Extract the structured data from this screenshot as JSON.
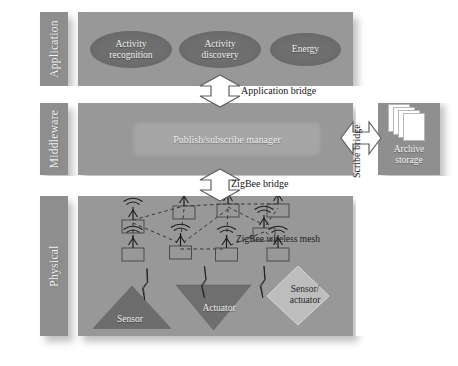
{
  "diagram": {
    "colors": {
      "background": "#ffffff",
      "panel": "#989898",
      "side_label_block": "#8e8e8e",
      "ellipse": "#6f6f6f",
      "manager_box": "#a6a6a6",
      "archive_block": "#8f8f8f",
      "device_dark": "#6d6d6d",
      "device_light": "#b9b9b9",
      "text_light": "#f2f2f2",
      "text_dark": "#151515"
    }
  },
  "layers": [
    {
      "name": "application",
      "side_label": "Application",
      "components": [
        {
          "label": "Activity\nrecognition",
          "line1": "Activity",
          "line2": "recognition",
          "shape": "ellipse"
        },
        {
          "label": "Activity\ndiscovery",
          "line1": "Activity",
          "line2": "discovery",
          "shape": "ellipse"
        },
        {
          "label": "Energy",
          "line1": "Energy",
          "line2": "",
          "shape": "ellipse"
        }
      ]
    },
    {
      "name": "middleware",
      "side_label": "Middleware",
      "components": [
        {
          "label": "Publish/subscribe manager",
          "shape": "rounded-rect"
        }
      ]
    },
    {
      "name": "physical",
      "side_label": "Physical",
      "mesh_label": "ZigBee wireless mesh",
      "devices": [
        {
          "label": "Sensor",
          "line1": "Sensor",
          "line2": "",
          "shape": "triangle-up"
        },
        {
          "label": "Actuator",
          "line1": "Actuator",
          "line2": "",
          "shape": "triangle-down"
        },
        {
          "label": "Sensor/actuator",
          "line1": "Sensor/",
          "line2": "actuator",
          "shape": "diamond"
        }
      ]
    }
  ],
  "external": {
    "archive": {
      "line1": "Archive",
      "line2": "storage",
      "icon": "stacked-pages-icon",
      "sheet_count": 4
    }
  },
  "bridges": [
    {
      "label": "Application bridge",
      "orientation": "vertical",
      "kind": "double-headed-arrow"
    },
    {
      "label": "ZigBee bridge",
      "orientation": "vertical",
      "kind": "double-headed-arrow"
    },
    {
      "label": "Scribe bridge",
      "orientation": "horizontal",
      "kind": "double-headed-arrow"
    }
  ],
  "mesh": {
    "node_count": 8,
    "node_icon": "antenna-node-icon",
    "nodes": [
      {
        "id": "n1",
        "x": 110,
        "y": 48
      },
      {
        "id": "n2",
        "x": 212,
        "y": 20
      },
      {
        "id": "n3",
        "x": 300,
        "y": 16
      },
      {
        "id": "n4",
        "x": 400,
        "y": 16
      },
      {
        "id": "n5",
        "x": 110,
        "y": 104
      },
      {
        "id": "n6",
        "x": 205,
        "y": 100
      },
      {
        "id": "n7",
        "x": 297,
        "y": 104
      },
      {
        "id": "n8",
        "x": 372,
        "y": 64
      }
    ],
    "links": [
      [
        "n1",
        "n2"
      ],
      [
        "n2",
        "n3"
      ],
      [
        "n3",
        "n4"
      ],
      [
        "n2",
        "n6"
      ],
      [
        "n1",
        "n5"
      ],
      [
        "n5",
        "n6"
      ],
      [
        "n6",
        "n7"
      ],
      [
        "n3",
        "n6"
      ],
      [
        "n3",
        "n8"
      ],
      [
        "n8",
        "n4"
      ],
      [
        "n8",
        "n7"
      ],
      [
        "n7",
        "n8"
      ]
    ],
    "wireless_links": {
      "icon": "lightning-bolt-icon",
      "count": 3
    }
  }
}
